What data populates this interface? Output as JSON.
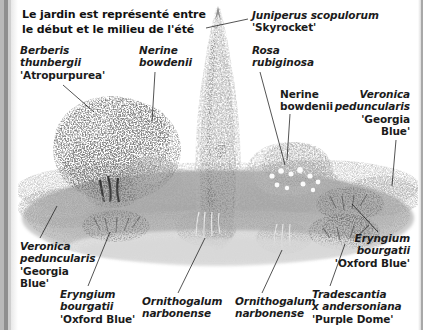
{
  "page": {
    "width": 423,
    "height": 330,
    "background": "#ffffff",
    "gutter_color": "#8f8f8f"
  },
  "title": {
    "line1": "Le jardin est représenté entre",
    "line2": "le début et le milieu de l'été"
  },
  "labels": [
    {
      "id": "juniperus-skyrocket",
      "species": "Juniperus scopulorum",
      "cultivar": "'Skyrocket'",
      "align": "left",
      "x": 252,
      "y": 9,
      "style": "italic",
      "leader": [
        [
          248,
          19
        ],
        [
          206,
          28
        ]
      ]
    },
    {
      "id": "berberis-atropurpurea",
      "species_line1": "Berberis",
      "species_line2": "thunbergii",
      "cultivar": "'Atropurpurea'",
      "align": "left",
      "x": 20,
      "y": 44,
      "style": "italic",
      "leader": [
        [
          63,
          85
        ],
        [
          94,
          112
        ]
      ]
    },
    {
      "id": "nerine-bowdenii-left",
      "species_line1": "Nerine",
      "species_line2": "bowdenii",
      "align": "left",
      "x": 139,
      "y": 44,
      "style": "italic",
      "leader": [
        [
          155,
          72
        ],
        [
          152,
          122
        ]
      ]
    },
    {
      "id": "rosa-rubiginosa",
      "species_line1": "Rosa",
      "species_line2": "rubiginosa",
      "align": "left",
      "x": 252,
      "y": 44,
      "style": "italic",
      "leader": [
        [
          260,
          72
        ],
        [
          285,
          165
        ]
      ]
    },
    {
      "id": "nerine-bowdenii-right",
      "species_line1": "Nerine",
      "species_line2": "bowdenii",
      "align": "left",
      "x": 280,
      "y": 88,
      "style": "bold",
      "leader": [
        [
          290,
          114
        ],
        [
          287,
          160
        ]
      ]
    },
    {
      "id": "veronica-georgia-blue-right",
      "species_line1": "Veronica",
      "species_line2": "peduncularis",
      "cultivar_line1": "'Georgia",
      "cultivar_line2": "Blue'",
      "align": "right",
      "x": 410,
      "y": 88,
      "style": "italic",
      "leader": [
        [
          396,
          140
        ],
        [
          392,
          186
        ]
      ]
    },
    {
      "id": "veronica-georgia-blue-left",
      "species_line1": "Veronica",
      "species_line2": "peduncularis",
      "cultivar_line1": "'Georgia",
      "cultivar_line2": "Blue'",
      "align": "left",
      "x": 20,
      "y": 240,
      "style": "italic",
      "leader": [
        [
          40,
          238
        ],
        [
          57,
          206
        ]
      ]
    },
    {
      "id": "eryngium-oxford-blue-left",
      "species_line1": "Eryngium",
      "species_line2": "bourgatii",
      "cultivar": "'Oxford Blue'",
      "align": "left",
      "x": 60,
      "y": 288,
      "style": "italic",
      "leader": [
        [
          88,
          286
        ],
        [
          110,
          232
        ]
      ]
    },
    {
      "id": "ornithogalum-narbonense-left",
      "species_line1": "Ornithogalum",
      "species_line2": "narbonense",
      "align": "left",
      "x": 142,
      "y": 295,
      "style": "italic",
      "leader": [
        [
          178,
          293
        ],
        [
          205,
          238
        ]
      ]
    },
    {
      "id": "ornithogalum-narbonense-right",
      "species_line1": "Ornithogalum",
      "species_line2": "narbonense",
      "align": "left",
      "x": 235,
      "y": 295,
      "style": "italic",
      "leader": [
        [
          262,
          293
        ],
        [
          282,
          250
        ]
      ]
    },
    {
      "id": "tradescantia-purple-dome",
      "species_line1": "Tradescantia",
      "species_line2": "x andersoniana",
      "cultivar": "'Purple Dome'",
      "align": "left",
      "x": 312,
      "y": 288,
      "style": "italic",
      "leader": [
        [
          330,
          286
        ],
        [
          345,
          244
        ]
      ]
    },
    {
      "id": "eryngium-oxford-blue-right",
      "species_line1": "Eryngium",
      "species_line2": "bourgatii",
      "cultivar": "'Oxford Blue'",
      "align": "right",
      "x": 410,
      "y": 232,
      "style": "italic",
      "leader": [
        [
          378,
          232
        ],
        [
          352,
          204
        ]
      ]
    }
  ]
}
